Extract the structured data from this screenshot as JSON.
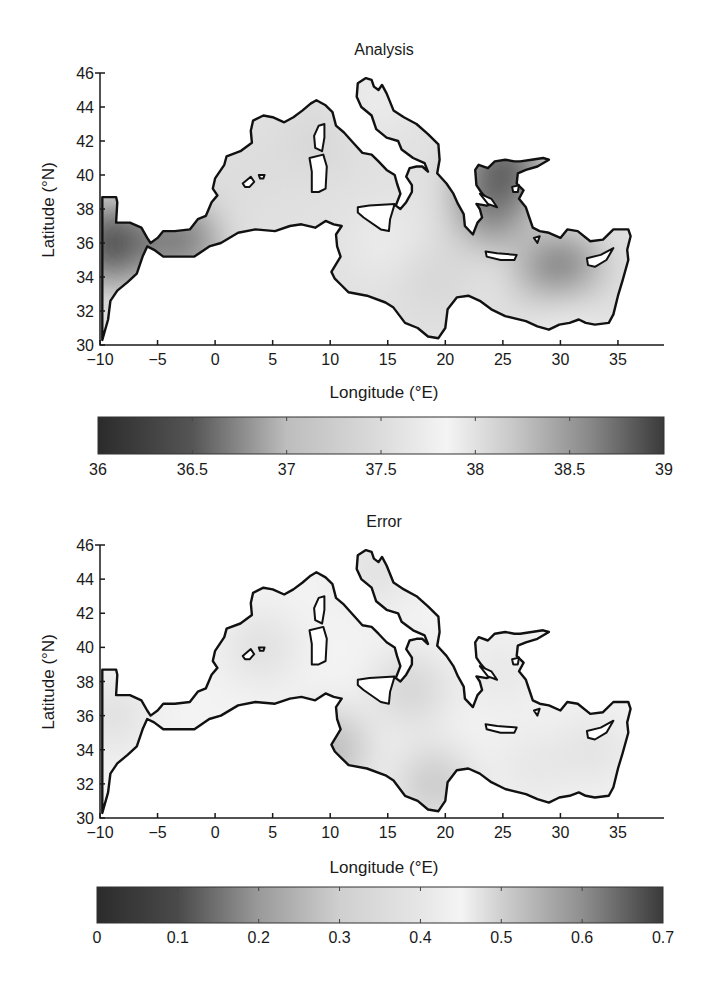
{
  "chart_data": [
    {
      "type": "heatmap",
      "title": "Analysis",
      "xlabel": "Longitude (°E)",
      "ylabel": "Latitude (°N)",
      "xlim": [
        -10,
        39
      ],
      "ylim": [
        30,
        46
      ],
      "xticks": [
        -10,
        -5,
        0,
        5,
        10,
        15,
        20,
        25,
        30,
        35
      ],
      "yticks": [
        30,
        32,
        34,
        36,
        38,
        40,
        42,
        44,
        46
      ],
      "colorbar": {
        "min": 36,
        "max": 39,
        "ticks": [
          36,
          36.5,
          37,
          37.5,
          38,
          38.5,
          39
        ],
        "tick_labels": [
          "36",
          "36.5",
          "37",
          "37.5",
          "38",
          "38.5",
          "39"
        ],
        "colormap_gray_stops": [
          [
            36,
            "#2b2b2b"
          ],
          [
            36.5,
            "#555555"
          ],
          [
            37,
            "#bdbdbd"
          ],
          [
            37.5,
            "#dcdcdc"
          ],
          [
            37.85,
            "#f4f4f4"
          ],
          [
            38.2,
            "#c8c8c8"
          ],
          [
            38.6,
            "#8a8a8a"
          ],
          [
            39,
            "#3a3a3a"
          ]
        ]
      },
      "field_samples": [
        {
          "lon": -9,
          "lat": 36,
          "value": 36.1
        },
        {
          "lon": -3,
          "lat": 36.2,
          "value": 36.6
        },
        {
          "lon": 3,
          "lat": 40,
          "value": 37.5
        },
        {
          "lon": 9,
          "lat": 42,
          "value": 37.4
        },
        {
          "lon": 15,
          "lat": 36,
          "value": 37.9
        },
        {
          "lon": 19,
          "lat": 34,
          "value": 38.1
        },
        {
          "lon": 24,
          "lat": 38,
          "value": 38.7
        },
        {
          "lon": 25,
          "lat": 40.3,
          "value": 36.3
        },
        {
          "lon": 30,
          "lat": 34,
          "value": 38.9
        },
        {
          "lon": 30.5,
          "lat": 31.3,
          "value": 37.9
        },
        {
          "lon": 14,
          "lat": 44.5,
          "value": 37.9
        }
      ]
    },
    {
      "type": "heatmap",
      "title": "Error",
      "xlabel": "Longitude (°E)",
      "ylabel": "Latitude (°N)",
      "xlim": [
        -10,
        39
      ],
      "ylim": [
        30,
        46
      ],
      "xticks": [
        -10,
        -5,
        0,
        5,
        10,
        15,
        20,
        25,
        30,
        35
      ],
      "yticks": [
        30,
        32,
        34,
        36,
        38,
        40,
        42,
        44,
        46
      ],
      "colorbar": {
        "min": 0,
        "max": 0.7,
        "ticks": [
          0,
          0.1,
          0.2,
          0.3,
          0.4,
          0.5,
          0.6,
          0.7
        ],
        "tick_labels": [
          "0",
          "0.1",
          "0.2",
          "0.3",
          "0.4",
          "0.5",
          "0.6",
          "0.7"
        ],
        "colormap_gray_stops": [
          [
            0,
            "#2b2b2b"
          ],
          [
            0.1,
            "#4a4a4a"
          ],
          [
            0.2,
            "#9a9a9a"
          ],
          [
            0.3,
            "#cfcfcf"
          ],
          [
            0.4,
            "#e6e6e6"
          ],
          [
            0.45,
            "#f4f4f4"
          ],
          [
            0.5,
            "#cfcfcf"
          ],
          [
            0.6,
            "#8f8f8f"
          ],
          [
            0.7,
            "#3a3a3a"
          ]
        ]
      },
      "field_samples": [
        {
          "lon": -9,
          "lat": 36,
          "value": 0.36
        },
        {
          "lon": 4,
          "lat": 40,
          "value": 0.36
        },
        {
          "lon": 10,
          "lat": 34,
          "value": 0.55
        },
        {
          "lon": 17,
          "lat": 37.5,
          "value": 0.5
        },
        {
          "lon": 19,
          "lat": 32,
          "value": 0.52
        },
        {
          "lon": 25,
          "lat": 38.5,
          "value": 0.4
        },
        {
          "lon": 27.5,
          "lat": 33,
          "value": 0.47
        },
        {
          "lon": 33,
          "lat": 34,
          "value": 0.38
        },
        {
          "lon": 14,
          "lat": 44.5,
          "value": 0.48
        }
      ]
    }
  ]
}
